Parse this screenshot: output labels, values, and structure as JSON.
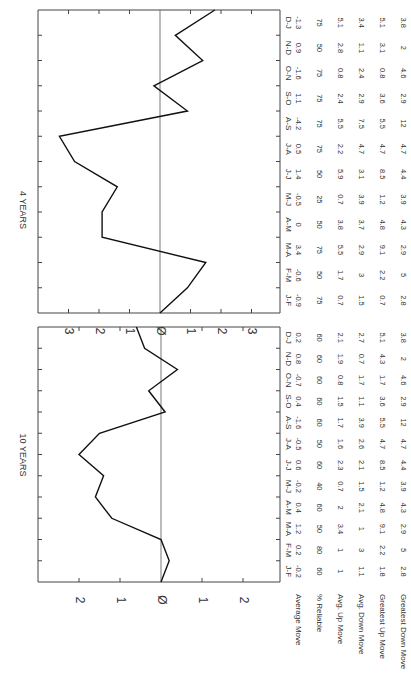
{
  "chart_data": [
    {
      "type": "line",
      "title": "4 YEARS",
      "categories": [
        "J-F",
        "F-M",
        "M-A",
        "A-M",
        "M-J",
        "J-J",
        "J-A",
        "A-S",
        "S-O",
        "O-N",
        "N-D",
        "D-J"
      ],
      "values": [
        -0.9,
        -0.6,
        3.4,
        0,
        -0.5,
        1.4,
        0.5,
        -4.2,
        1.1,
        -1.6,
        0.9,
        -1.3
      ],
      "plotted_cumulative": [
        0,
        -0.9,
        -1.5,
        1.9,
        1.9,
        1.4,
        2.8,
        3.3,
        -0.9,
        0.2,
        -1.4,
        -0.5,
        -1.8
      ],
      "yticks": [
        "3",
        "2",
        "1",
        "0",
        "1",
        "2",
        "3"
      ],
      "ylim": [
        -3.5,
        3.5
      ],
      "grid": false,
      "table": {
        "rows": [
          {
            "label": "Average Move",
            "values": [
              "-0.9",
              "-0.6",
              "3.4",
              "0",
              "-0.5",
              "1.4",
              "0.5",
              "-4.2",
              "1.1",
              "-1.6",
              "0.9",
              "-1.3"
            ]
          },
          {
            "label": "% Reliable",
            "values": [
              "75",
              "50",
              "75",
              "50",
              "25",
              "50",
              "75",
              "75",
              "75",
              "75",
              "50",
              "75"
            ]
          },
          {
            "label": "Avg. Up Move",
            "values": [
              "0.7",
              "1.7",
              "5.5",
              "3.8",
              "0.7",
              "5.9",
              "2.2",
              "5.5",
              "2.4",
              "0.8",
              "2.8",
              "5.1"
            ]
          },
          {
            "label": "Avg. Down Move",
            "values": [
              "1.5",
              "3",
              "2.9",
              "3.7",
              "3.9",
              "3.1",
              "4.7",
              "7.5",
              "2.9",
              "2.4",
              "1.1",
              "3.4"
            ]
          },
          {
            "label": "Greatest Up Move",
            "values": [
              "0.7",
              "2.2",
              "9.1",
              "4.8",
              "1.2",
              "8.5",
              "4.7",
              "5.5",
              "3.6",
              "0.8",
              "3.1",
              "5.1"
            ]
          },
          {
            "label": "Greatest Down Move",
            "values": [
              "2.8",
              "5",
              "2.9",
              "4.3",
              "3.9",
              "4.4",
              "4.7",
              "12",
              "2.9",
              "4.6",
              "2",
              "3.8"
            ]
          }
        ]
      }
    },
    {
      "type": "line",
      "title": "10 YEARS",
      "categories": [
        "J-F",
        "F-M",
        "M-A",
        "A-M",
        "M-J",
        "J-J",
        "J-A",
        "A-S",
        "S-O",
        "O-N",
        "N-D",
        "D-J"
      ],
      "values": [
        -0.2,
        0.2,
        1.2,
        0.4,
        -0.2,
        0.6,
        -0.5,
        -1.6,
        0.4,
        -0.7,
        0.8,
        0.2
      ],
      "plotted_cumulative": [
        0,
        -0.2,
        0,
        1.2,
        1.6,
        1.4,
        2.0,
        1.5,
        -0.1,
        0.3,
        -0.4,
        0.4,
        0.6
      ],
      "yticks": [
        "2",
        "1",
        "0",
        "1",
        "2"
      ],
      "ylim": [
        -2.5,
        2.5
      ],
      "grid": false,
      "table": {
        "rows": [
          {
            "label": "Average Move",
            "values": [
              "-0.2",
              "0.2",
              "1.2",
              "0.4",
              "-0.2",
              "0.6",
              "-0.5",
              "-1.6",
              "0.4",
              "-0.7",
              "0.8",
              "0.2"
            ]
          },
          {
            "label": "% Reliable",
            "values": [
              "60",
              "80",
              "50",
              "60",
              "40",
              "60",
              "50",
              "60",
              "60",
              "60",
              "60",
              "60"
            ]
          },
          {
            "label": "Avg. Up Move",
            "values": [
              "1",
              "1",
              "3.4",
              "2",
              "0.7",
              "2.3",
              "1.6",
              "1.7",
              "1.5",
              "0.8",
              "1.9",
              "2.1"
            ]
          },
          {
            "label": "Avg. Down Move",
            "values": [
              "1.1",
              "3",
              "1",
              "2.1",
              "1.5",
              "2.1",
              "2.6",
              "3.9",
              "1.1",
              "1.7",
              "0.7",
              "2.7"
            ]
          },
          {
            "label": "Greatest Up Move",
            "values": [
              "1.8",
              "2.2",
              "9.1",
              "4.8",
              "1.2",
              "8.5",
              "4.7",
              "5.5",
              "3.6",
              "1.7",
              "4.3",
              "5.1"
            ]
          },
          {
            "label": "Greatest Down Move",
            "values": [
              "2.8",
              "5",
              "2.9",
              "4.3",
              "3.9",
              "4.4",
              "4.7",
              "12",
              "2.9",
              "4.6",
              "2",
              "3.8"
            ]
          }
        ]
      }
    }
  ]
}
